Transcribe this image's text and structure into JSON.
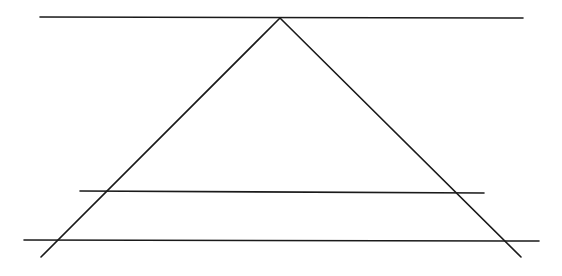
{
  "canvas": {
    "width": 562,
    "height": 276,
    "background": "#ffffff"
  },
  "stroke": {
    "color": "#1a1a1a",
    "width": 1.6
  },
  "diagram": {
    "apex": {
      "x": 280,
      "y": 18
    },
    "lines": [
      {
        "id": "top-horizontal-line",
        "x1": 40,
        "y1": 17,
        "x2": 523,
        "y2": 18
      },
      {
        "id": "middle-horizontal-line",
        "x1": 80,
        "y1": 191,
        "x2": 484,
        "y2": 193
      },
      {
        "id": "bottom-horizontal-line",
        "x1": 24,
        "y1": 240,
        "x2": 539,
        "y2": 241
      },
      {
        "id": "left-diagonal-line",
        "x1": 280,
        "y1": 18,
        "x2": 41,
        "y2": 257
      },
      {
        "id": "right-diagonal-line",
        "x1": 280,
        "y1": 18,
        "x2": 521,
        "y2": 257
      }
    ]
  }
}
